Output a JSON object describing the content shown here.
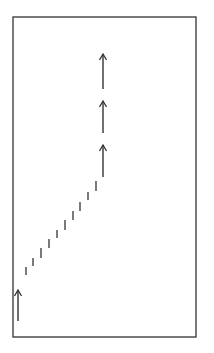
{
  "diagram": {
    "colors": {
      "stroke": "#333333",
      "background": "#ffffff"
    },
    "frame": {
      "x": 13,
      "y": 17,
      "width": 183,
      "height": 320
    },
    "bottom_arrow": {
      "x": 18,
      "y1": 321,
      "y2": 290
    },
    "dashes": [
      {
        "x": 26,
        "y1": 275,
        "y2": 267
      },
      {
        "x": 33,
        "y1": 266,
        "y2": 258
      },
      {
        "x": 41,
        "y1": 258,
        "y2": 248
      },
      {
        "x": 49,
        "y1": 248,
        "y2": 239
      },
      {
        "x": 57,
        "y1": 238,
        "y2": 230
      },
      {
        "x": 65,
        "y1": 230,
        "y2": 220
      },
      {
        "x": 73,
        "y1": 220,
        "y2": 211
      },
      {
        "x": 80,
        "y1": 211,
        "y2": 202
      },
      {
        "x": 88,
        "y1": 200,
        "y2": 192
      },
      {
        "x": 96,
        "y1": 191,
        "y2": 181
      }
    ],
    "top_arrows": [
      {
        "x": 103,
        "y1": 177,
        "y2": 145
      },
      {
        "x": 103,
        "y1": 133,
        "y2": 101
      },
      {
        "x": 103,
        "y1": 89,
        "y2": 54
      }
    ]
  }
}
